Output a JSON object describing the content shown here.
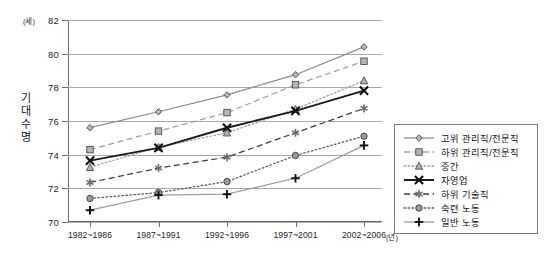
{
  "chart_data": {
    "type": "line",
    "title": "",
    "xlabel": "",
    "ylabel": "기대수명",
    "y_unit": "(세)",
    "x_unit": "(년)",
    "grid": true,
    "legend_position": "right",
    "ylim": [
      70,
      82
    ],
    "yticks": [
      70,
      72,
      74,
      76,
      78,
      80,
      82
    ],
    "categories": [
      "1982~1986",
      "1987~1991",
      "1992~1996",
      "1997~2001",
      "2002~2006"
    ],
    "series": [
      {
        "name": "고위 관리직/전문직",
        "marker": "diamond",
        "line": "solid",
        "color": "#8c8c8c",
        "values": [
          75.6,
          76.55,
          77.55,
          78.75,
          80.4
        ]
      },
      {
        "name": "하위 관리직/전문직",
        "marker": "square",
        "line": "dashed",
        "color": "#a0a0a0",
        "values": [
          74.3,
          75.4,
          76.5,
          78.15,
          79.55
        ]
      },
      {
        "name": "중간",
        "marker": "triangle",
        "line": "dotted",
        "color": "#9a9a9a",
        "values": [
          73.25,
          74.45,
          75.3,
          76.7,
          78.4
        ]
      },
      {
        "name": "자영업",
        "marker": "x-cross",
        "line": "solid",
        "color": "#1a1a1a",
        "values": [
          73.65,
          74.4,
          75.6,
          76.6,
          77.8
        ]
      },
      {
        "name": "하위 기술직",
        "marker": "asterisk",
        "line": "dashed",
        "color": "#3c3c3c",
        "values": [
          72.35,
          73.2,
          73.85,
          75.3,
          76.75
        ]
      },
      {
        "name": "숙련 노동",
        "marker": "circle",
        "line": "dotted",
        "color": "#5a5a5a",
        "values": [
          71.4,
          71.75,
          72.4,
          73.95,
          75.1
        ]
      },
      {
        "name": "일반 노동",
        "marker": "plus",
        "line": "solid",
        "color": "#9d9d9d",
        "values": [
          70.7,
          71.6,
          71.65,
          72.6,
          74.55
        ]
      }
    ]
  }
}
